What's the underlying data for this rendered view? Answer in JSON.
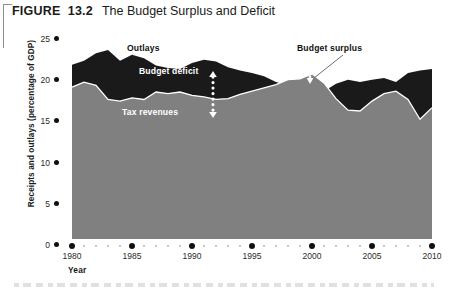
{
  "figure": {
    "number": "FIGURE  13.2",
    "title": "The Budget Surplus and Deficit"
  },
  "chart_data": {
    "type": "area",
    "title": "The Budget Surplus and Deficit",
    "xlabel": "Year",
    "ylabel": "Receipts and outlays (percentage of GDP)",
    "xlim": [
      1980,
      2010
    ],
    "ylim": [
      0,
      25
    ],
    "xticks": [
      1980,
      1985,
      1990,
      1995,
      2000,
      2005,
      2010
    ],
    "yticks": [
      0,
      5,
      10,
      15,
      20,
      25
    ],
    "grid": false,
    "legend": "in-plot annotations",
    "annotations": [
      {
        "text": "Outlays",
        "note": "labels the upper dark band boundary"
      },
      {
        "text": "Budget deficit",
        "note": "vertical white double arrow between tax revenues and outlays"
      },
      {
        "text": "Tax revenues",
        "note": "labels the lower gray area"
      },
      {
        "text": "Budget surplus",
        "note": "leader line to small white gap near 2000 where revenues exceed outlays"
      }
    ],
    "x": [
      1980,
      1981,
      1982,
      1983,
      1984,
      1985,
      1986,
      1987,
      1988,
      1989,
      1990,
      1991,
      1992,
      1993,
      1994,
      1995,
      1996,
      1997,
      1998,
      1999,
      2000,
      2001,
      2002,
      2003,
      2004,
      2005,
      2006,
      2007,
      2008,
      2009,
      2010
    ],
    "series": [
      {
        "name": "Outlays",
        "color": "#1a1a1a",
        "values": [
          21.7,
          22.2,
          23.1,
          23.5,
          22.2,
          22.9,
          22.5,
          21.6,
          21.3,
          21.2,
          21.9,
          22.3,
          22.1,
          21.4,
          21.0,
          20.7,
          20.3,
          19.6,
          19.2,
          18.6,
          18.4,
          18.5,
          19.4,
          19.9,
          19.6,
          19.9,
          20.1,
          19.6,
          20.7,
          21.0,
          21.2
        ]
      },
      {
        "name": "Tax revenues",
        "color": "#808080",
        "values": [
          19.0,
          19.6,
          19.2,
          17.5,
          17.3,
          17.7,
          17.5,
          18.4,
          18.2,
          18.4,
          18.0,
          17.8,
          17.5,
          17.6,
          18.1,
          18.5,
          18.9,
          19.3,
          19.9,
          20.0,
          20.6,
          19.5,
          17.6,
          16.2,
          16.1,
          17.3,
          18.2,
          18.5,
          17.5,
          15.1,
          16.5
        ]
      }
    ]
  }
}
